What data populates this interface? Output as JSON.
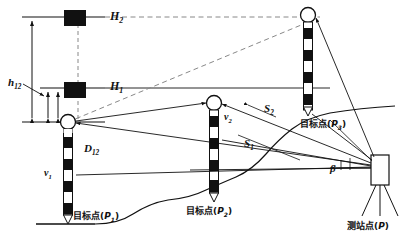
{
  "figure": {
    "type": "surveying-diagram"
  },
  "labels": {
    "h12": {
      "base": "h",
      "sub": "12"
    },
    "H1": {
      "base": "H",
      "sub": "1"
    },
    "H2": {
      "base": "H",
      "sub": "2"
    },
    "v1": {
      "base": "v",
      "sub": "1"
    },
    "v2": {
      "base": "v",
      "sub": "2"
    },
    "D12": {
      "base": "D",
      "sub": "12"
    },
    "S1": {
      "base": "S",
      "sub": "1"
    },
    "S2": {
      "base": "S",
      "sub": "2"
    },
    "beta": {
      "base": "β",
      "sub": ""
    }
  },
  "points": {
    "target1": {
      "prefix": "目标点",
      "open": "(",
      "base": "P",
      "sub": "1",
      "close": ")"
    },
    "target2": {
      "prefix": "目标点",
      "open": "(",
      "base": "P",
      "sub": "2",
      "close": ")"
    },
    "target3": {
      "prefix": "目标点",
      "open": "(",
      "base": "P",
      "sub": "3",
      "close": ")"
    },
    "station": {
      "prefix": "测站点",
      "open": "(",
      "base": "P",
      "sub": "",
      "close": ")"
    }
  },
  "colors": {
    "ink": "#111111",
    "line": "#2b2b2b",
    "dashed": "#7a7a7a",
    "fill_dark": "#111111",
    "fill_light": "#ffffff"
  }
}
